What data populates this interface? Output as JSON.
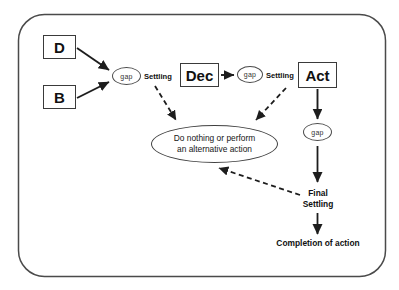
{
  "diagram": {
    "container": {
      "name": "outer-rounded-frame",
      "shape": "rounded-rectangle"
    },
    "colors": {
      "stroke": "#3a3a3a",
      "text": "#111111",
      "background": "#ffffff"
    },
    "nodes": {
      "d": {
        "label": "D",
        "shape": "rectangle"
      },
      "b": {
        "label": "B",
        "shape": "rectangle"
      },
      "dec": {
        "label": "Dec",
        "shape": "rectangle"
      },
      "act": {
        "label": "Act",
        "shape": "rectangle"
      },
      "gap1": {
        "label": "gap",
        "shape": "ellipse"
      },
      "gap2": {
        "label": "gap",
        "shape": "ellipse"
      },
      "gap3": {
        "label": "gap",
        "shape": "ellipse"
      },
      "alternative": {
        "line1": "Do nothing or perform",
        "line2": "an alternative action",
        "shape": "ellipse"
      }
    },
    "edge_labels": {
      "settling_1": "Settling",
      "settling_2": "Settling"
    },
    "terminal_labels": {
      "final_settling_line1": "Final",
      "final_settling_line2": "Settling",
      "completion": "Completion of action"
    },
    "edges": [
      {
        "from": "d",
        "to": "gap1",
        "style": "solid-arrow"
      },
      {
        "from": "b",
        "to": "gap1",
        "style": "solid-arrow"
      },
      {
        "from": "dec",
        "to": "gap2",
        "style": "solid-arrow"
      },
      {
        "from": "act",
        "to": "gap3",
        "style": "solid-arrow"
      },
      {
        "from": "gap3",
        "to": "final_settling",
        "style": "solid-arrow"
      },
      {
        "from": "final_settling",
        "to": "completion",
        "style": "solid-arrow"
      },
      {
        "from": "settling_1",
        "to": "alternative",
        "style": "dashed-arrow"
      },
      {
        "from": "settling_2",
        "to": "alternative",
        "style": "dashed-arrow"
      },
      {
        "from": "final_settling",
        "to": "alternative",
        "style": "dashed-arrow"
      }
    ]
  }
}
